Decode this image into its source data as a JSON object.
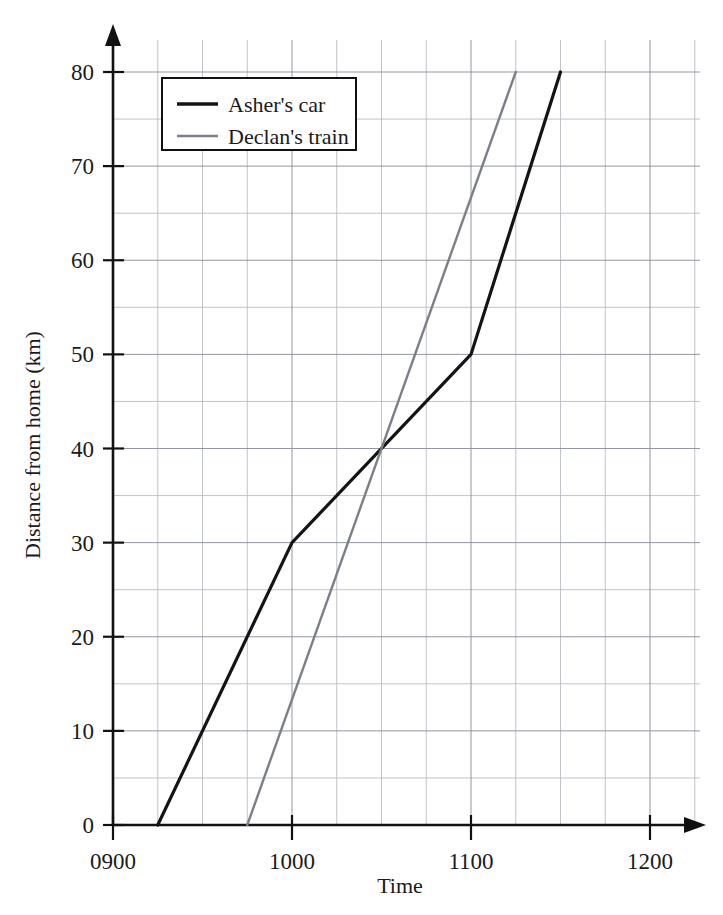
{
  "chart_data": {
    "type": "line",
    "title": "",
    "xlabel": "Time",
    "ylabel": "Distance from home (km)",
    "xlim": [
      900,
      1200
    ],
    "ylim": [
      0,
      80
    ],
    "grid": true,
    "legend_position": "top-left",
    "x_tick_labels": [
      "0900",
      "1000",
      "1100",
      "1200"
    ],
    "x_tick_values": [
      900,
      1000,
      1100,
      1200
    ],
    "y_tick_labels": [
      "0",
      "10",
      "20",
      "30",
      "40",
      "50",
      "60",
      "70",
      "80"
    ],
    "y_tick_values": [
      0,
      10,
      20,
      30,
      40,
      50,
      60,
      70,
      80
    ],
    "x_minor_step_minutes": 15,
    "y_minor_step_km": 5,
    "series": [
      {
        "name": "Asher's car",
        "color": "#141414",
        "width": 3.2,
        "points": [
          {
            "time": "0915",
            "x": 915,
            "y": 0
          },
          {
            "time": "1000",
            "x": 1000,
            "y": 30
          },
          {
            "time": "1100",
            "x": 1100,
            "y": 50
          },
          {
            "time": "1130",
            "x": 1130,
            "y": 80
          }
        ]
      },
      {
        "name": "Declan's train",
        "color": "#7b7f87",
        "width": 2.4,
        "points": [
          {
            "time": "0945",
            "x": 945,
            "y": 0
          },
          {
            "time": "1115",
            "x": 1115,
            "y": 80
          }
        ]
      }
    ],
    "annotations": [
      {
        "label": "intersection",
        "x": 1050,
        "y": 40
      }
    ]
  },
  "axes": {
    "y_title": "Distance from home (km)",
    "x_title": "Time",
    "y_ticks": [
      "80",
      "70",
      "60",
      "50",
      "40",
      "30",
      "20",
      "10",
      "0"
    ],
    "x_ticks": [
      "0900",
      "1000",
      "1100",
      "1200"
    ]
  },
  "legend": {
    "entries": [
      {
        "label": "Asher's car",
        "color": "#141414"
      },
      {
        "label": "Declan's train",
        "color": "#7b7f87"
      }
    ]
  },
  "colors": {
    "car_line": "#141414",
    "train_line": "#7b7f87",
    "grid_minor": "#b9bcc4",
    "grid_major": "#9296a0",
    "axis": "#111111",
    "background": "#ffffff"
  }
}
